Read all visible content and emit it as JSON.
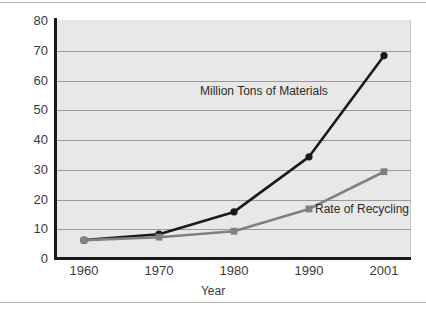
{
  "figure": {
    "background_color": "#ffffff",
    "plot_background_color": "#e8e8e8",
    "gridline_color": "#9a9a9a",
    "axis_color": "#1a1a1a"
  },
  "labels": {
    "materials_series_label": "Million Tons of Materials",
    "recycling_series_label": "Rate of Recycling",
    "xaxis_title": "Year"
  },
  "chart_data": {
    "type": "line",
    "title": "",
    "xlabel": "Year",
    "ylabel": "",
    "x": [
      "1960",
      "1970",
      "1980",
      "1990",
      "2001"
    ],
    "categories": [
      "1960",
      "1970",
      "1980",
      "1990",
      "2001"
    ],
    "ylim": [
      0,
      80
    ],
    "yticks": [
      0,
      10,
      20,
      30,
      40,
      50,
      60,
      70,
      80
    ],
    "ytick_labels": [
      "0",
      "10",
      "20",
      "30",
      "40",
      "50",
      "60",
      "70",
      "80"
    ],
    "grid": true,
    "legend_position": "inline-annotations",
    "series": [
      {
        "name": "Million Tons of Materials",
        "values": [
          6,
          8,
          15.5,
          34,
          68
        ],
        "color": "#1a1a1a",
        "marker": "circle"
      },
      {
        "name": "Rate of Recycling",
        "values": [
          6,
          7,
          9,
          16.5,
          29
        ],
        "color": "#808080",
        "marker": "square"
      }
    ]
  }
}
